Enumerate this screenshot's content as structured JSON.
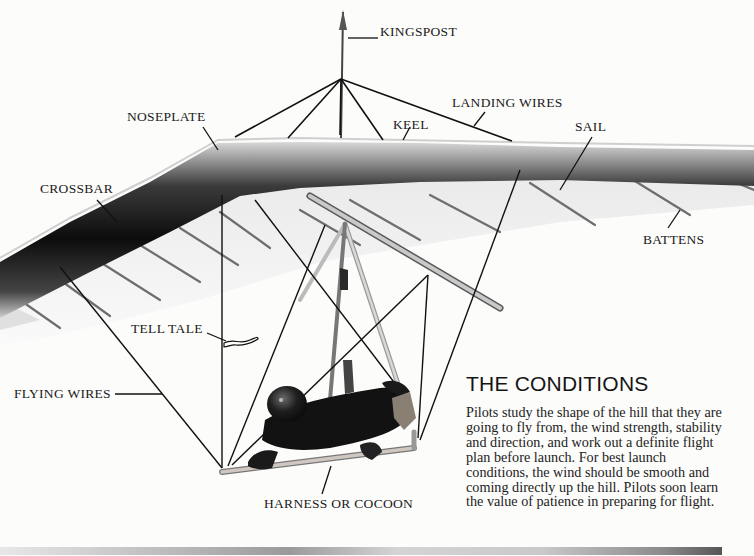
{
  "diagram": {
    "labels": {
      "kingspost": "KINGSPOST",
      "landing_wires": "LANDING WIRES",
      "noseplate": "NOSEPLATE",
      "keel": "KEEL",
      "sail": "SAIL",
      "crossbar": "CROSSBAR",
      "battens": "BATTENS",
      "tell_tale": "TELL TALE",
      "flying_wires": "FLYING WIRES",
      "harness": "HARNESS OR COCOON"
    }
  },
  "article": {
    "heading": "THE CONDITIONS",
    "body": "Pilots study the shape of the hill that they are going to fly from, the wind strength, stability and direction, and work out a definite flight plan before launch. For best launch conditions, the wind should be smooth and coming directly up the hill. Pilots soon learn the value of patience in preparing for flight."
  }
}
